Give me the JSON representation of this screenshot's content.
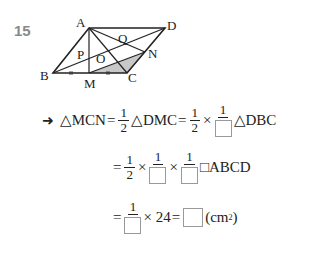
{
  "problem": {
    "number": "15",
    "figure": {
      "points": {
        "A": {
          "label": "A",
          "x": 89,
          "y": 28
        },
        "D": {
          "label": "D",
          "x": 165,
          "y": 28
        },
        "B": {
          "label": "B",
          "x": 53,
          "y": 73
        },
        "C": {
          "label": "C",
          "x": 127,
          "y": 73
        },
        "M": {
          "label": "M",
          "x": 89,
          "y": 73
        },
        "N": {
          "label": "N",
          "x": 145,
          "y": 52
        },
        "P": {
          "label": "P"
        },
        "O": {
          "label": "O"
        },
        "Q": {
          "label": "Q"
        }
      },
      "shaded": "MCN",
      "shade_color": "#c8c8c8"
    },
    "solution": {
      "arrow": "➜",
      "line1": {
        "lhs": "△MCN",
        "eq1": "=",
        "f1_num": "1",
        "f1_den": "2",
        "t1": "△DMC",
        "eq2": "=",
        "f2_num": "1",
        "f2_den": "2",
        "times": "×",
        "f3_num": "1",
        "t2": "△DBC"
      },
      "line2": {
        "eq": "=",
        "f1_num": "1",
        "f1_den": "2",
        "times1": "×",
        "f2_num": "1",
        "times2": "×",
        "f3_num": "1",
        "t": "□ABCD"
      },
      "line3": {
        "eq1": "=",
        "f_num": "1",
        "mult": "× 24",
        "eq2": "=",
        "unit": "(cm",
        "unit_sup": "2",
        "unit_close": ")"
      }
    }
  }
}
